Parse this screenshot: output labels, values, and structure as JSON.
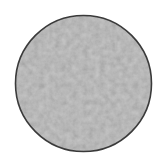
{
  "swatch": {
    "shape": "circle",
    "texture": "mottled-felt",
    "fill_base_color": "#c8c8c8",
    "fill_light_color": "#dedede",
    "fill_dark_color": "#b4b4b4",
    "outline_color": "#3a3a3a",
    "background_color": "#ffffff"
  }
}
